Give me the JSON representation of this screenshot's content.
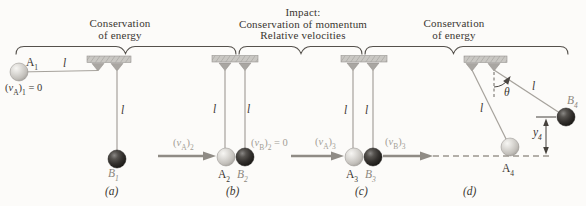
{
  "figure": "pendulum-impact-stages",
  "colors": {
    "background": "#fcfbf9",
    "dark_text": "#3a3631",
    "gray_text": "#a39e96",
    "b_label_text": "#8d8880",
    "bracket": "#55514c",
    "string": "#a6a29c",
    "arrow": "#8f8b85",
    "support_fill": "#c9c7c3",
    "light_ball": "#d9d7d3",
    "dark_ball": "#34312e"
  },
  "headers": {
    "left": {
      "line1": "Conservation",
      "line2": "of energy"
    },
    "middle": {
      "line1": "Impact:",
      "line2": "Conservation of momentum",
      "line3": "Relative velocities"
    },
    "right": {
      "line1": "Conservation",
      "line2": "of energy"
    }
  },
  "symbols": {
    "length": "l",
    "theta": "θ"
  },
  "diagrams": {
    "a": {
      "caption": "(a)",
      "ball_a": {
        "base": "A",
        "sub": "1"
      },
      "ball_b": {
        "base": "B",
        "sub": "1"
      },
      "velocity_a": {
        "p1": "(",
        "v": "v",
        "s1": "A",
        "p2": ")",
        "s2": "1",
        "rest": " = 0"
      }
    },
    "b": {
      "caption": "(b)",
      "ball_a": {
        "base": "A",
        "sub": "2"
      },
      "ball_b": {
        "base": "B",
        "sub": "2"
      },
      "velocity_a": {
        "p1": "(",
        "v": "v",
        "s1": "A",
        "p2": ")",
        "s2": "2",
        "rest": ""
      },
      "velocity_b": {
        "p1": "(",
        "v": "v",
        "s1": "B",
        "p2": ")",
        "s2": "2",
        "rest": " = 0"
      }
    },
    "c": {
      "caption": "(c)",
      "ball_a": {
        "base": "A",
        "sub": "3"
      },
      "ball_b": {
        "base": "B",
        "sub": "3"
      },
      "velocity_a": {
        "p1": "(",
        "v": "v",
        "s1": "A",
        "p2": ")",
        "s2": "3",
        "rest": ""
      },
      "velocity_b": {
        "p1": "(",
        "v": "v",
        "s1": "B",
        "p2": ")",
        "s2": "3",
        "rest": ""
      }
    },
    "d": {
      "caption": "(d)",
      "ball_a": {
        "base": "A",
        "sub": "4"
      },
      "ball_b": {
        "base": "B",
        "sub": "4"
      },
      "height": {
        "base": "y",
        "sub": "4"
      }
    }
  }
}
